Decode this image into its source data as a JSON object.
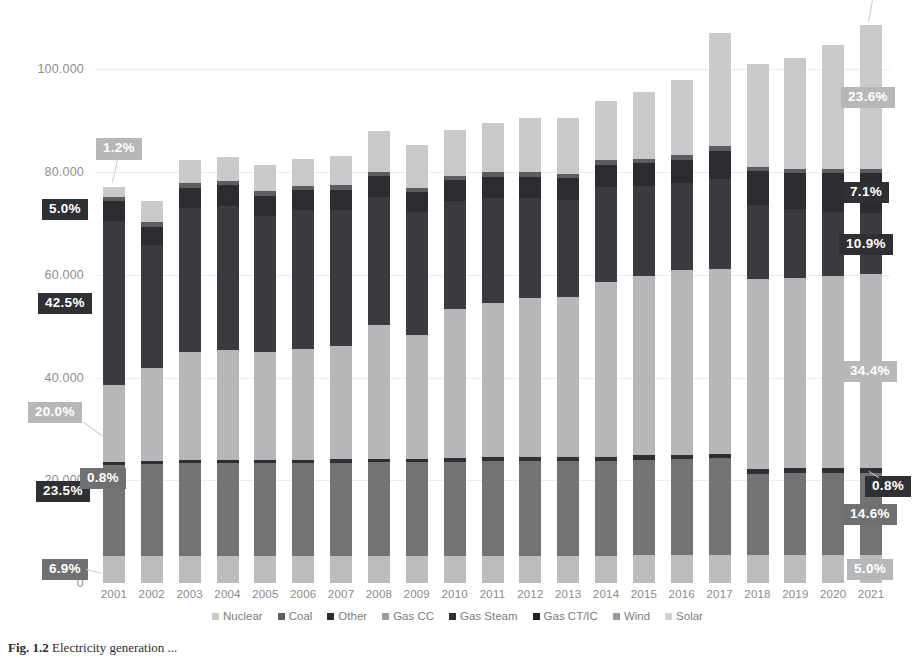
{
  "chart_data": {
    "type": "bar",
    "stacked": true,
    "title": "",
    "subtitle": "",
    "xlabel": "",
    "ylabel": "",
    "grid": true,
    "legend_position": "bottom",
    "ylim": [
      0,
      110000
    ],
    "yticks": [
      "0",
      "20.000",
      "40.000",
      "60.000",
      "80.000",
      "100.000"
    ],
    "ytick_values": [
      0,
      20000,
      40000,
      60000,
      80000,
      100000
    ],
    "categories": [
      "2001",
      "2002",
      "2003",
      "2004",
      "2005",
      "2006",
      "2007",
      "2008",
      "2009",
      "2010",
      "2011",
      "2012",
      "2013",
      "2014",
      "2015",
      "2016",
      "2017",
      "2018",
      "2019",
      "2020",
      "2021"
    ],
    "series": [
      {
        "name": "Solar",
        "color": "#bcbcbc",
        "values": [
          5200,
          5300,
          5300,
          5300,
          5300,
          5300,
          5300,
          5300,
          5300,
          5300,
          5300,
          5300,
          5300,
          5300,
          5400,
          5400,
          5500,
          5500,
          5500,
          5500,
          5500
        ]
      },
      {
        "name": "Wind",
        "color": "#737373",
        "values": [
          17700,
          17900,
          18000,
          18000,
          18100,
          18100,
          18100,
          18200,
          18200,
          18300,
          18400,
          18400,
          18500,
          18500,
          18600,
          18700,
          18800,
          15800,
          15900,
          15900,
          16000
        ]
      },
      {
        "name": "Gas CT/IC",
        "color": "#2f3033",
        "values": [
          600,
          600,
          650,
          650,
          650,
          650,
          700,
          700,
          700,
          700,
          750,
          750,
          800,
          800,
          850,
          850,
          900,
          900,
          900,
          900,
          900
        ]
      },
      {
        "name": "Gas Steam",
        "color": "#b6b7b8",
        "values": [
          15000,
          18000,
          21000,
          21500,
          21000,
          21500,
          22000,
          26000,
          24000,
          29000,
          30000,
          31000,
          31000,
          34000,
          35000,
          36000,
          36000,
          37000,
          37000,
          37500,
          37700
        ]
      },
      {
        "name": "Gas CC",
        "color": "#3a3b3e",
        "values": [
          32000,
          24000,
          28000,
          28000,
          26500,
          27000,
          26500,
          25000,
          24000,
          21000,
          20500,
          19500,
          19000,
          18500,
          17500,
          17000,
          17500,
          14500,
          13500,
          12500,
          11900
        ]
      },
      {
        "name": "Other",
        "color": "#2b2c2f",
        "values": [
          3800,
          3600,
          4000,
          4000,
          3900,
          3900,
          3900,
          4000,
          3900,
          4100,
          4200,
          4200,
          4200,
          4300,
          4400,
          4500,
          5500,
          6500,
          7000,
          7500,
          7800
        ]
      },
      {
        "name": "Coal",
        "color": "#5c5d60",
        "values": [
          900,
          900,
          900,
          900,
          900,
          900,
          900,
          900,
          900,
          900,
          900,
          900,
          900,
          900,
          900,
          900,
          900,
          900,
          900,
          900,
          900
        ]
      },
      {
        "name": "Nuclear",
        "color": "#c9c9c9",
        "values": [
          2000,
          4000,
          4500,
          4600,
          5000,
          5300,
          5800,
          8000,
          8200,
          9000,
          9500,
          10500,
          10800,
          11500,
          13000,
          14500,
          22000,
          20000,
          21500,
          24000,
          28000
        ]
      }
    ],
    "bar_labels": {
      "2001": [
        {
          "series": "Solar",
          "text": "6.9%",
          "style": "mid"
        },
        {
          "series": "Wind",
          "text": "23.5%",
          "style": "dark"
        },
        {
          "series": "Gas CT/IC",
          "text": "0.8%",
          "style": "mid"
        },
        {
          "series": "Gas Steam",
          "text": "20.0%",
          "style": "light"
        },
        {
          "series": "Gas CC",
          "text": "42.5%",
          "style": "dark"
        },
        {
          "series": "Other",
          "text": "5.0%",
          "style": "dark"
        },
        {
          "series": "Nuclear",
          "text": "1.2%",
          "style": "light"
        }
      ],
      "2021": [
        {
          "series": "Solar",
          "text": "5.0%",
          "style": "light"
        },
        {
          "series": "Wind",
          "text": "14.6%",
          "style": "mid"
        },
        {
          "series": "Gas CT/IC",
          "text": "0.8%",
          "style": "dark"
        },
        {
          "series": "Gas Steam",
          "text": "34.4%",
          "style": "light"
        },
        {
          "series": "Gas CC",
          "text": "10.9%",
          "style": "dark"
        },
        {
          "series": "Other",
          "text": "7.1%",
          "style": "dark"
        },
        {
          "series": "Nuclear",
          "text": "23.6%",
          "style": "light"
        },
        {
          "series": "Top",
          "text": "3.5%",
          "style": "pale"
        }
      ]
    }
  },
  "legend": {
    "items": [
      {
        "label": "Nuclear",
        "color": "#c9c9c9"
      },
      {
        "label": "Coal",
        "color": "#5c5d60"
      },
      {
        "label": "Other",
        "color": "#2b2c2f"
      },
      {
        "label": "Gas CC",
        "color": "#9d9d9d"
      },
      {
        "label": "Gas Steam",
        "color": "#2f3033"
      },
      {
        "label": "Gas CT/IC",
        "color": "#1f2022"
      },
      {
        "label": "Wind",
        "color": "#9a9a9a"
      },
      {
        "label": "Solar",
        "color": "#d2d2d2"
      }
    ]
  },
  "caption": {
    "figure_number": "Fig. 1.2",
    "text": "Electricity generation ..."
  }
}
